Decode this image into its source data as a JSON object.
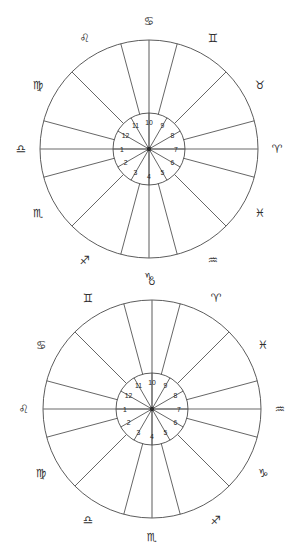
{
  "page": {
    "background_color": "#ffffff",
    "line_color": "#4a4a4a",
    "text_color": "#1f1f1f"
  },
  "chart_data": [
    {
      "type": "pie",
      "title": "Zodiac wheel chart 1",
      "chart_id": "chart-1",
      "center": {
        "x": 149,
        "y": 149
      },
      "outer_radius": 109,
      "inner_radius": 36,
      "label_radius": 128,
      "sector_count": 12,
      "sector_span_degrees": 30,
      "grid": false,
      "legend_position": "none",
      "outer_ring_label": "zodiac signs",
      "inner_ring_label": "house numbers",
      "categories": [
        "Aries",
        "Pisces",
        "Aquarius",
        "Capricorn",
        "Sagittarius",
        "Scorpio",
        "Libra",
        "Virgo",
        "Leo",
        "Cancer",
        "Gemini",
        "Taurus"
      ],
      "values": [
        30,
        30,
        30,
        30,
        30,
        30,
        30,
        30,
        30,
        30,
        30,
        30
      ],
      "sectors": [
        {
          "sign": "Aries",
          "glyph": "♈",
          "angle": 0,
          "house": 7
        },
        {
          "sign": "Pisces",
          "glyph": "♓",
          "angle": -30,
          "house": 6
        },
        {
          "sign": "Aquarius",
          "glyph": "♒",
          "angle": -60,
          "house": 5
        },
        {
          "sign": "Capricorn",
          "glyph": "♑",
          "angle": -90,
          "house": 4
        },
        {
          "sign": "Sagittarius",
          "glyph": "♐",
          "angle": -120,
          "house": 3
        },
        {
          "sign": "Scorpio",
          "glyph": "♏",
          "angle": -150,
          "house": 2
        },
        {
          "sign": "Libra",
          "glyph": "♎",
          "angle": 180,
          "house": 1
        },
        {
          "sign": "Virgo",
          "glyph": "♍",
          "angle": 150,
          "house": 12
        },
        {
          "sign": "Leo",
          "glyph": "♌",
          "angle": 120,
          "house": 11
        },
        {
          "sign": "Cancer",
          "glyph": "♋",
          "angle": 90,
          "house": 10
        },
        {
          "sign": "Gemini",
          "glyph": "♊",
          "angle": 60,
          "house": 9
        },
        {
          "sign": "Taurus",
          "glyph": "♉",
          "angle": 30,
          "house": 8
        }
      ]
    },
    {
      "type": "pie",
      "title": "Zodiac wheel chart 2",
      "chart_id": "chart-2",
      "center": {
        "x": 152,
        "y": 409
      },
      "outer_radius": 109,
      "inner_radius": 36,
      "label_radius": 128,
      "sector_count": 12,
      "sector_span_degrees": 30,
      "grid": false,
      "legend_position": "none",
      "outer_ring_label": "zodiac signs",
      "inner_ring_label": "house numbers",
      "categories": [
        "Aquarius",
        "Capricorn",
        "Sagittarius",
        "Scorpio",
        "Libra",
        "Virgo",
        "Leo",
        "Cancer",
        "Gemini",
        "Taurus",
        "Aries",
        "Pisces"
      ],
      "values": [
        30,
        30,
        30,
        30,
        30,
        30,
        30,
        30,
        30,
        30,
        30,
        30
      ],
      "sectors": [
        {
          "sign": "Aquarius",
          "glyph": "♒",
          "angle": 0,
          "house": 7
        },
        {
          "sign": "Capricorn",
          "glyph": "♑",
          "angle": -30,
          "house": 6
        },
        {
          "sign": "Sagittarius",
          "glyph": "♐",
          "angle": -60,
          "house": 5
        },
        {
          "sign": "Scorpio",
          "glyph": "♏",
          "angle": -90,
          "house": 4
        },
        {
          "sign": "Libra",
          "glyph": "♎",
          "angle": -120,
          "house": 3
        },
        {
          "sign": "Virgo",
          "glyph": "♍",
          "angle": -150,
          "house": 2
        },
        {
          "sign": "Leo",
          "glyph": "♌",
          "angle": 180,
          "house": 1
        },
        {
          "sign": "Cancer",
          "glyph": "♋",
          "angle": 150,
          "house": 12
        },
        {
          "sign": "Gemini",
          "glyph": "♊",
          "angle": 120,
          "house": 11
        },
        {
          "sign": "Taurus",
          "glyph": "♉",
          "angle": 90,
          "house": 10
        },
        {
          "sign": "Aries",
          "glyph": "♈",
          "angle": 60,
          "house": 9
        },
        {
          "sign": "Pisces",
          "glyph": "♓",
          "angle": 30,
          "house": 8
        }
      ]
    }
  ]
}
